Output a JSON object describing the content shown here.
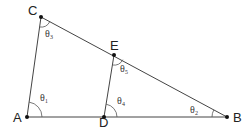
{
  "diagram": {
    "type": "geometry-triangle",
    "points": {
      "A": {
        "label": "A",
        "x": 27,
        "y": 117
      },
      "B": {
        "label": "B",
        "x": 227,
        "y": 117
      },
      "C": {
        "label": "C",
        "x": 41,
        "y": 17
      },
      "D": {
        "label": "D",
        "x": 104,
        "y": 117
      },
      "E": {
        "label": "E",
        "x": 114,
        "y": 55
      }
    },
    "segments": [
      "AB",
      "AC",
      "CB",
      "DE"
    ],
    "angles": {
      "theta1": {
        "label": "θ₁",
        "at": "A"
      },
      "theta2": {
        "label": "θ₂",
        "at": "B"
      },
      "theta3": {
        "label": "θ₃",
        "at": "C"
      },
      "theta4": {
        "label": "θ₄",
        "at": "D"
      },
      "theta5": {
        "label": "θ₅",
        "at": "E"
      }
    },
    "colors": {
      "line": "#333333",
      "point": "#111111",
      "text": "#222222"
    }
  }
}
